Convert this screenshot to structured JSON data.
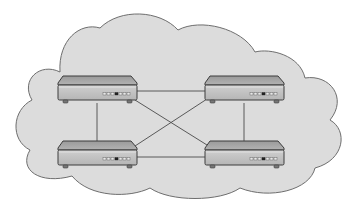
{
  "diagram": {
    "type": "network-topology",
    "topology": "full-mesh",
    "colors": {
      "background": "#ffffff",
      "cloud_fill": "#dcdcdc",
      "cloud_stroke": "#6e6e6e",
      "link": "#4a4a4a",
      "device_top": "#a9a9a9",
      "device_front": "#c4c4c4",
      "device_stroke": "#3c3c3c",
      "led_off": "#e8e8e8",
      "led_on": "#222222"
    },
    "cloud": {
      "label": "network-cloud"
    },
    "nodes": [
      {
        "id": "top-left",
        "kind": "router",
        "x": 58,
        "y": 76
      },
      {
        "id": "top-right",
        "kind": "router",
        "x": 205,
        "y": 76
      },
      {
        "id": "bottom-left",
        "kind": "router",
        "x": 58,
        "y": 141
      },
      {
        "id": "bottom-right",
        "kind": "router",
        "x": 205,
        "y": 141
      }
    ],
    "links": [
      {
        "from": "top-left",
        "to": "top-right"
      },
      {
        "from": "top-left",
        "to": "bottom-left"
      },
      {
        "from": "top-left",
        "to": "bottom-right"
      },
      {
        "from": "top-right",
        "to": "bottom-left"
      },
      {
        "from": "top-right",
        "to": "bottom-right"
      },
      {
        "from": "bottom-left",
        "to": "bottom-right"
      }
    ]
  }
}
